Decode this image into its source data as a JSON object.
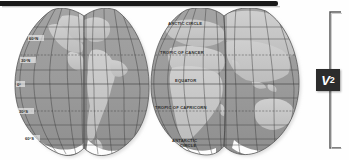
{
  "figure": {
    "kind": "interrupted-world-map",
    "projection_name": "Goode homolosine interrupted projection",
    "label_badge": "V",
    "label_badge_subscript": "2",
    "bracket": "vertical-brace",
    "colors": {
      "ocean": "#9a9a9a",
      "land": "#c6c6c6",
      "ice": "#fdfdfd",
      "graticule": "#3a3a3a",
      "outline": "#4a4a4a",
      "top_bar": "#1a1a1a",
      "badge_bg": "#2c2c2c",
      "badge_text": "#ffffff",
      "background": "#fefefe"
    }
  },
  "map": {
    "latitude_labels": [
      {
        "text": "60°N",
        "y": 31,
        "x": 31
      },
      {
        "text": "30°N",
        "y": 53,
        "x": 24
      },
      {
        "text": "0°",
        "y": 78,
        "x": 19
      },
      {
        "text": "30°S",
        "y": 104,
        "x": 22
      },
      {
        "text": "60°S",
        "y": 131,
        "x": 28
      }
    ],
    "named_circles": [
      {
        "text": "ARCTIC CIRCLE",
        "y": 19,
        "x": 187,
        "dashed": false
      },
      {
        "text": "TROPIC OF CANCER",
        "y": 47,
        "x": 185,
        "dashed": true
      },
      {
        "text": "EQUATOR",
        "y": 76,
        "x": 190,
        "dashed": false
      },
      {
        "text": "TROPIC OF CAPRICORN",
        "y": 103,
        "x": 186,
        "dashed": true
      },
      {
        "text": "ANTARCTIC",
        "y": 134,
        "x": 189,
        "dashed": false
      },
      {
        "text": "CIRCLE",
        "y": 139,
        "x": 193,
        "dashed": false
      }
    ],
    "lobes": [
      {
        "name": "north-america-west-lobe",
        "center_x": 52
      },
      {
        "name": "south-america-lobe",
        "center_x": 112
      },
      {
        "name": "europe-africa-lobe",
        "center_x": 186
      },
      {
        "name": "asia-australia-lobe",
        "center_x": 258
      }
    ]
  }
}
